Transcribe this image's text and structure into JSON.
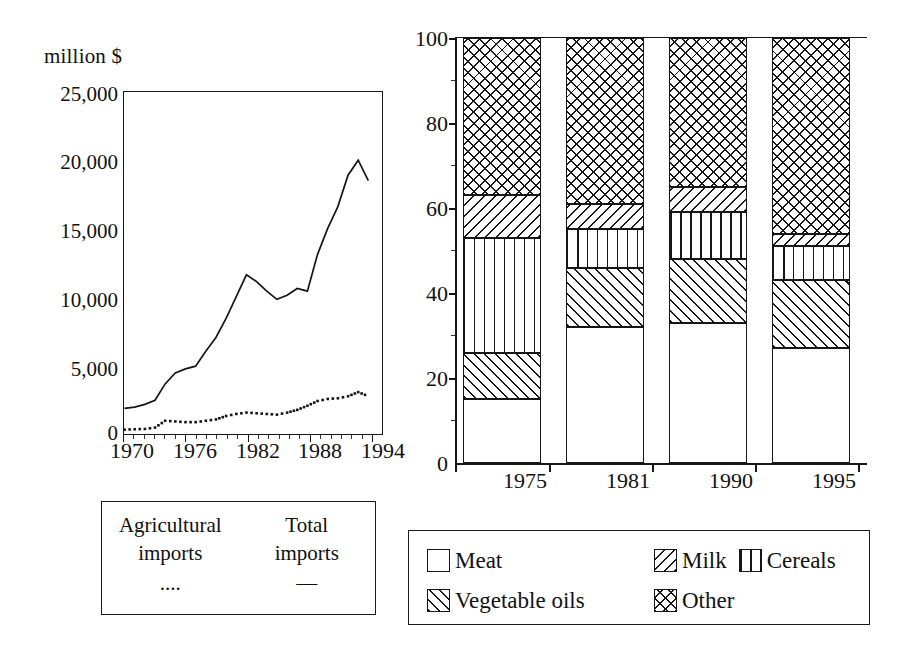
{
  "chart_data": [
    {
      "type": "line",
      "title": "",
      "ylabel": "million $",
      "xlabel": "",
      "ylim": [
        0,
        25000
      ],
      "xlim": [
        1970,
        1995
      ],
      "grid": false,
      "legend_position": "below-plot",
      "y_ticks": [
        "0",
        "5,000",
        "10,000",
        "15,000",
        "20,000",
        "25,000"
      ],
      "y_tick_values": [
        0,
        5000,
        10000,
        15000,
        20000,
        25000
      ],
      "x_ticks": [
        "1970",
        "1976",
        "1982",
        "1988",
        "1994"
      ],
      "x_tick_values": [
        1970,
        1976,
        1982,
        1988,
        1994
      ],
      "x": [
        1970,
        1971,
        1972,
        1973,
        1974,
        1975,
        1976,
        1977,
        1978,
        1979,
        1980,
        1981,
        1982,
        1983,
        1984,
        1985,
        1986,
        1987,
        1988,
        1989,
        1990,
        1991,
        1992,
        1993,
        1994
      ],
      "series": [
        {
          "name": "Total imports",
          "style": "solid",
          "values": [
            1800,
            1900,
            2100,
            2400,
            3600,
            4400,
            4700,
            4900,
            6000,
            7000,
            8400,
            10000,
            11600,
            11100,
            10400,
            9800,
            10100,
            10600,
            10400,
            13100,
            15000,
            16600,
            18900,
            20000,
            18500
          ]
        },
        {
          "name": "Agricultural imports",
          "style": "dotted",
          "values": [
            250,
            280,
            300,
            400,
            900,
            850,
            800,
            800,
            900,
            1000,
            1250,
            1400,
            1500,
            1450,
            1400,
            1350,
            1500,
            1700,
            2000,
            2350,
            2500,
            2550,
            2700,
            3000,
            2700
          ]
        }
      ],
      "legend_entries": [
        {
          "label_line1": "Agricultural",
          "label_line2": "imports",
          "sample": "...."
        },
        {
          "label_line1": "Total",
          "label_line2": "imports",
          "sample": "—"
        }
      ]
    },
    {
      "type": "bar",
      "subtype": "stacked-100-percent",
      "title": "",
      "xlabel": "",
      "ylabel": "",
      "ylim": [
        0,
        100
      ],
      "grid": false,
      "legend_position": "below-plot",
      "y_ticks": [
        "0",
        "20",
        "40",
        "60",
        "80",
        "100"
      ],
      "y_tick_values": [
        0,
        20,
        40,
        60,
        80,
        100
      ],
      "categories": [
        "1975",
        "1981",
        "1990",
        "1995"
      ],
      "series": [
        {
          "name": "Meat",
          "pattern": "blank",
          "values": [
            15,
            32,
            33,
            27
          ]
        },
        {
          "name": "Vegetable oils",
          "pattern": "fwd-hatch",
          "values": [
            11,
            14,
            15,
            16
          ]
        },
        {
          "name": "Cereals",
          "pattern": "vertical",
          "values": [
            27,
            9,
            11,
            8
          ]
        },
        {
          "name": "Milk",
          "pattern": "back-hatch",
          "values": [
            10,
            6,
            6,
            3
          ]
        },
        {
          "name": "Other",
          "pattern": "crosshatch",
          "values": [
            37,
            39,
            35,
            46
          ]
        }
      ],
      "legend_entries": [
        {
          "label": "Meat",
          "pattern": "blank"
        },
        {
          "label": "Milk",
          "pattern": "back-hatch"
        },
        {
          "label": "Cereals",
          "pattern": "vertical"
        },
        {
          "label": "Vegetable oils",
          "pattern": "fwd-hatch"
        },
        {
          "label": "Other",
          "pattern": "crosshatch"
        }
      ]
    }
  ],
  "left": {
    "unit_label": "million $",
    "y_ticks": [
      "25,000",
      "20,000",
      "15,000",
      "10,000",
      "5,000",
      "0"
    ],
    "x_ticks": [
      "1970",
      "1976",
      "1982",
      "1988",
      "1994"
    ],
    "legend": {
      "col1_line1": "Agricultural",
      "col1_line2": "imports",
      "col1_sample": "....",
      "col2_line1": "Total",
      "col2_line2": "imports",
      "col2_sample": "—"
    }
  },
  "right": {
    "y_ticks": [
      "100",
      "80",
      "60",
      "40",
      "20",
      "0"
    ],
    "x_ticks": [
      "1975",
      "1981",
      "1990",
      "1995"
    ],
    "legend": {
      "meat": "Meat",
      "milk": "Milk",
      "cereals": "Cereals",
      "vegetable_oils": "Vegetable oils",
      "other": "Other"
    }
  },
  "colors": {
    "ink": "#161616",
    "background": "#ffffff"
  }
}
